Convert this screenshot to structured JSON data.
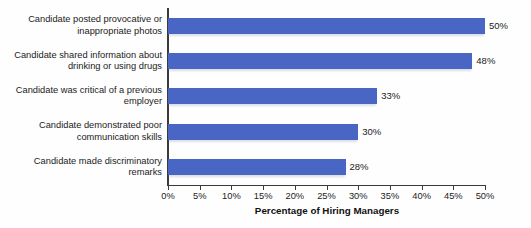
{
  "chart_data": {
    "type": "bar",
    "orientation": "horizontal",
    "title": "",
    "xlabel": "Percentage of Hiring Managers",
    "ylabel": "",
    "xlim": [
      0,
      50
    ],
    "grid": false,
    "legend": null,
    "bar_color": "#4a66c4",
    "categories": [
      "Candidate posted provocative or inappropriate photos",
      "Candidate shared information about drinking or using drugs",
      "Candidate was critical of a previous employer",
      "Candidate demonstrated poor communication skills",
      "Candidate made discriminatory remarks"
    ],
    "values": [
      50,
      48,
      33,
      30,
      28
    ],
    "value_labels": [
      "50%",
      "48%",
      "33%",
      "30%",
      "28%"
    ],
    "xticks": [
      0,
      5,
      10,
      15,
      20,
      25,
      30,
      35,
      40,
      45,
      50
    ],
    "xtick_labels": [
      "0%",
      "5%",
      "10%",
      "15%",
      "20%",
      "25%",
      "30%",
      "35%",
      "40%",
      "45%",
      "50%"
    ]
  }
}
